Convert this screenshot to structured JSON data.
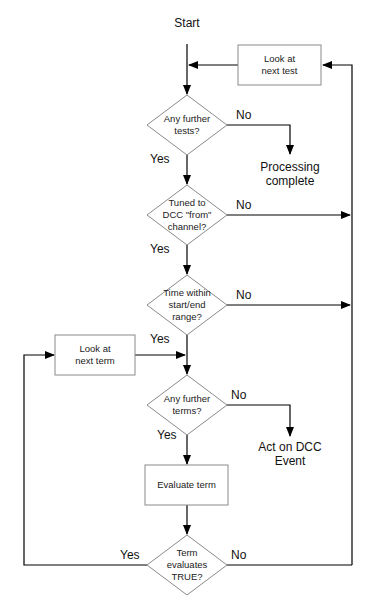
{
  "diagram": {
    "type": "flowchart",
    "start": "Start",
    "nodes": {
      "look_next_test": "Look at\nnext test",
      "any_further_tests": "Any further\ntests?",
      "processing_complete": "Processing\ncomplete",
      "tuned_to_channel": "Tuned to\nDCC \"from\"\nchannel?",
      "time_within_range": "Time within\nstart/end\nrange?",
      "look_next_term": "Look at\nnext term",
      "any_further_terms": "Any further\nterms?",
      "act_on_event": "Act on DCC\nEvent",
      "evaluate_term": "Evaluate term",
      "term_true": "Term\nevaluates\nTRUE?"
    },
    "labels": {
      "yes": "Yes",
      "no": "No"
    },
    "colors": {
      "line": "#000000",
      "shape_border": "#888888",
      "background": "#ffffff"
    }
  }
}
